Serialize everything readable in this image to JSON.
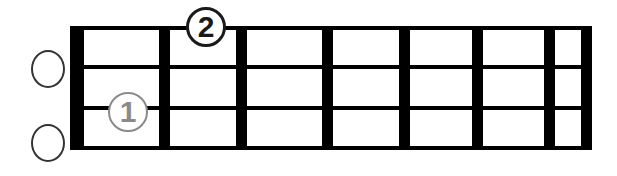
{
  "diagram": {
    "kind": "fretboard-chord-diagram",
    "instrument_strings": 4,
    "fret_count": 7,
    "background_color": "#ffffff",
    "line_color": "#000000",
    "open_marker_color": "#333333",
    "finger1_color": "#8a8a8a",
    "finger2_color": "#1a1a1a"
  },
  "strings": [
    {
      "index": 1,
      "name": "string-1"
    },
    {
      "index": 2,
      "name": "string-2"
    },
    {
      "index": 3,
      "name": "string-3"
    },
    {
      "index": 4,
      "name": "string-4"
    }
  ],
  "frets": [
    {
      "index": 0,
      "name": "nut"
    },
    {
      "index": 1,
      "name": "fret-bar-1"
    },
    {
      "index": 2,
      "name": "fret-bar-2"
    },
    {
      "index": 3,
      "name": "fret-bar-3"
    },
    {
      "index": 4,
      "name": "fret-bar-4"
    },
    {
      "index": 5,
      "name": "fret-bar-5"
    },
    {
      "index": 6,
      "name": "fret-bar-6"
    },
    {
      "index": 7,
      "name": "fret-bar-7"
    }
  ],
  "open_strings": [
    {
      "string": 1,
      "icon": "open-string-circle-icon"
    },
    {
      "string": 4,
      "icon": "open-string-circle-icon"
    }
  ],
  "finger_markers": [
    {
      "label": "1",
      "string": 3,
      "fret": 1,
      "color": "#8a8a8a"
    },
    {
      "label": "2",
      "string": 1,
      "fret": 2,
      "color": "#1a1a1a"
    }
  ]
}
